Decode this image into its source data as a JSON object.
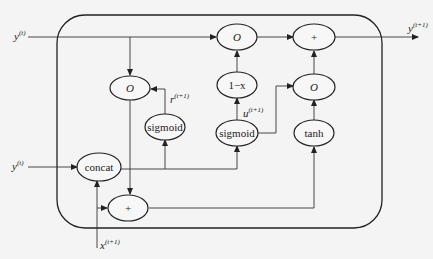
{
  "diagram": {
    "colors": {
      "background": "#f4f4f4",
      "stroke": "#222222"
    },
    "inputs": {
      "y_top": {
        "base": "y",
        "sup": "(t)"
      },
      "y_mid": {
        "base": "y",
        "sup": "(t)"
      },
      "x_bottom": {
        "base": "x",
        "sup": "(t+1)"
      }
    },
    "output": {
      "base": "y",
      "sup": "(t+1)"
    },
    "nodes": {
      "mult_left": "O",
      "mult_top": "O",
      "add_top": "+",
      "one_minus": "1−x",
      "mult_right": "O",
      "sigmoid_reset": "sigmoid",
      "sigmoid_update": "sigmoid",
      "tanh": "tanh",
      "concat": "concat",
      "add_bottom": "+"
    },
    "edge_labels": {
      "reset": {
        "base": "r",
        "sup": "(t+1)"
      },
      "update": {
        "base": "u",
        "sup": "(t+1)"
      }
    }
  }
}
